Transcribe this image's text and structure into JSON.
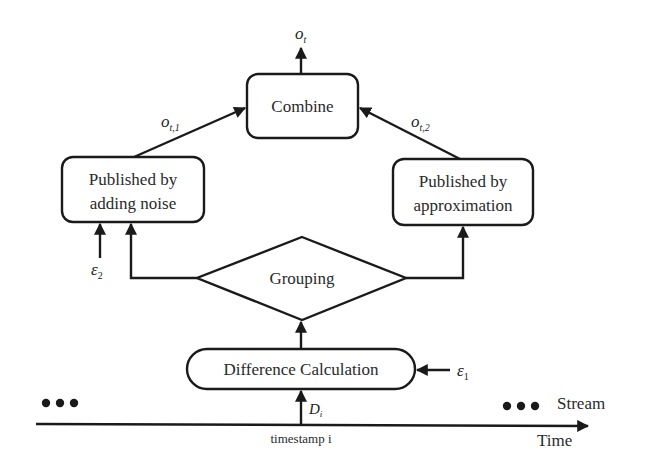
{
  "diagram": {
    "nodes": {
      "combine": {
        "label": "Combine"
      },
      "noise": {
        "line1": "Published by",
        "line2": "adding noise"
      },
      "approx": {
        "line1": "Published by",
        "line2": "approximation"
      },
      "grouping": {
        "label": "Grouping"
      },
      "difference": {
        "label": "Difference Calculation"
      }
    },
    "labels": {
      "output": {
        "base": "o",
        "sub": "t"
      },
      "output1": {
        "base": "o",
        "sub": "t,1"
      },
      "output2": {
        "base": "o",
        "sub": "t,2"
      },
      "epsilon1": {
        "base": "ε",
        "sub": "1"
      },
      "epsilon2": {
        "base": "ε",
        "sub": "2"
      },
      "data": {
        "base": "D",
        "sub": "i"
      },
      "timestamp": "timestamp i",
      "stream": "Stream",
      "time": "Time",
      "ellipsis_left": "•••",
      "ellipsis_right": "•••"
    },
    "colors": {
      "stroke": "#1a1a1a",
      "text": "#2a2a2a",
      "background": "#ffffff"
    }
  }
}
